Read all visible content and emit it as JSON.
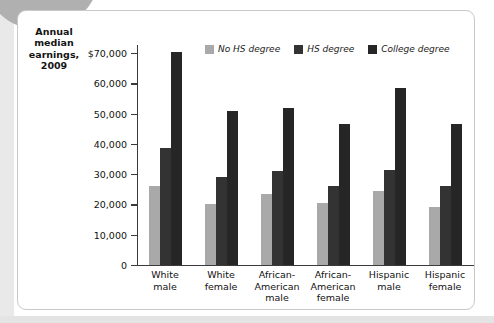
{
  "figure": {
    "axis_title": "Annual median earnings, 2009"
  },
  "colors": {
    "no_hs": "#a9a9a9",
    "hs": "#333333",
    "college": "#262626",
    "axis": "#3a3a3a",
    "frame": "#c9c9c9",
    "corner_blob": "#b0b0b0"
  },
  "legend": [
    {
      "label": "No HS degree",
      "color": "#a9a9a9"
    },
    {
      "label": "HS degree",
      "color": "#333333"
    },
    {
      "label": "College degree",
      "color": "#262626"
    }
  ],
  "y_axis": {
    "ticks": [
      {
        "value": 70000,
        "label": "$70,000"
      },
      {
        "value": 60000,
        "label": "60,000"
      },
      {
        "value": 50000,
        "label": "50,000"
      },
      {
        "value": 40000,
        "label": "40,000"
      },
      {
        "value": 30000,
        "label": "30,000"
      },
      {
        "value": 20000,
        "label": "20,000"
      },
      {
        "value": 10000,
        "label": "10,000"
      },
      {
        "value": 0,
        "label": "0"
      }
    ]
  },
  "chart_data": {
    "type": "bar",
    "title": "Annual median earnings, 2009",
    "xlabel": "",
    "ylabel": "Annual median earnings, 2009",
    "ylim": [
      0,
      72000
    ],
    "ytick_step": 10000,
    "grid": false,
    "legend_position": "top-right",
    "categories": [
      "White male",
      "White female",
      "African-American male",
      "African-American female",
      "Hispanic male",
      "Hispanic female"
    ],
    "category_lines": [
      [
        "White",
        "male"
      ],
      [
        "White",
        "female"
      ],
      [
        "African-",
        "American",
        "male"
      ],
      [
        "African-",
        "American",
        "female"
      ],
      [
        "Hispanic",
        "male"
      ],
      [
        "Hispanic",
        "female"
      ]
    ],
    "series": [
      {
        "name": "No HS degree",
        "color": "#a9a9a9",
        "values": [
          26000,
          20000,
          23500,
          20500,
          24500,
          19000
        ]
      },
      {
        "name": "HS degree",
        "color": "#333333",
        "values": [
          38500,
          29000,
          31000,
          26000,
          31500,
          26000
        ]
      },
      {
        "name": "College degree",
        "color": "#262626",
        "values": [
          70500,
          51000,
          52000,
          46500,
          58500,
          46500
        ]
      }
    ]
  }
}
